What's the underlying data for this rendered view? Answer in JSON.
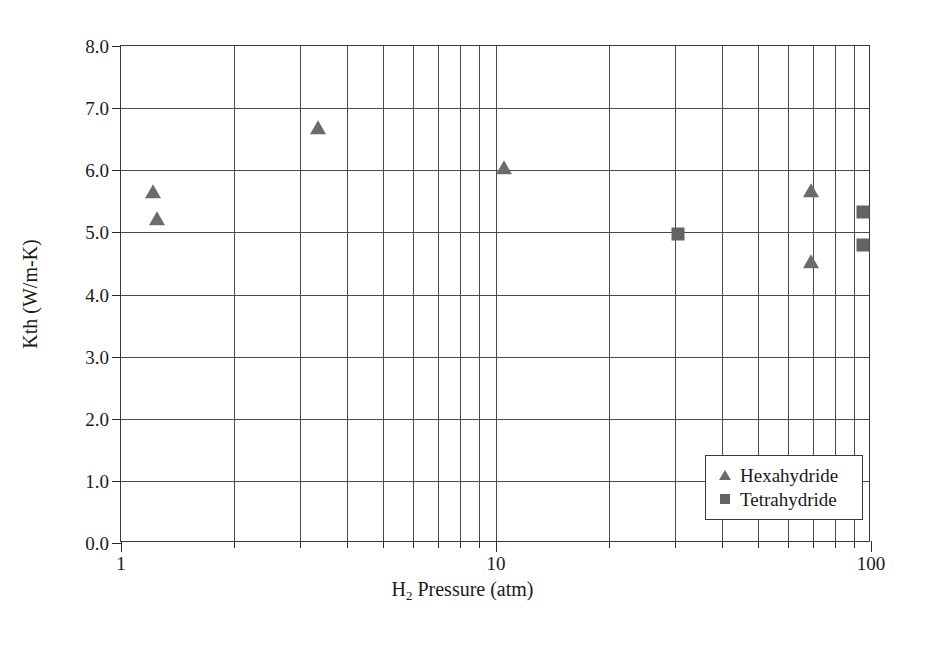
{
  "chart_data": {
    "type": "scatter",
    "title": "",
    "xlabel": "H2 Pressure (atm)",
    "xlabel_prefix": "H",
    "xlabel_sub": "2",
    "xlabel_suffix": " Pressure (atm)",
    "ylabel": "Kth (W/m-K)",
    "xscale": "log",
    "yscale": "linear",
    "xlim": [
      1,
      100
    ],
    "ylim": [
      0.0,
      8.0
    ],
    "grid": true,
    "grid_minor_x": true,
    "legend_position": "lower-right",
    "x_major_ticks": [
      1,
      10,
      100
    ],
    "x_major_tick_labels": [
      "1",
      "10",
      "100"
    ],
    "x_minor_ticks": [
      2,
      3,
      4,
      5,
      6,
      7,
      8,
      9,
      20,
      30,
      40,
      50,
      60,
      70,
      80,
      90
    ],
    "y_ticks": [
      0.0,
      1.0,
      2.0,
      3.0,
      4.0,
      5.0,
      6.0,
      7.0,
      8.0
    ],
    "y_tick_labels": [
      "0.0",
      "1.0",
      "2.0",
      "3.0",
      "4.0",
      "5.0",
      "6.0",
      "7.0",
      "8.0"
    ],
    "marker_color_hexahydride": "#6b6b6b",
    "marker_color_tetrahydride": "#636363",
    "series": [
      {
        "name": "Hexahydride",
        "marker": "triangle",
        "color": "#6b6b6b",
        "points": [
          {
            "x": 1.22,
            "y": 5.65
          },
          {
            "x": 1.25,
            "y": 5.21
          },
          {
            "x": 3.36,
            "y": 6.68
          },
          {
            "x": 10.5,
            "y": 6.04
          },
          {
            "x": 69.0,
            "y": 5.67
          },
          {
            "x": 69.0,
            "y": 4.52
          }
        ]
      },
      {
        "name": "Tetrahydride",
        "marker": "square",
        "color": "#636363",
        "points": [
          {
            "x": 30.5,
            "y": 4.97
          },
          {
            "x": 95.0,
            "y": 5.33
          },
          {
            "x": 95.0,
            "y": 4.79
          }
        ]
      }
    ],
    "legend_entries": [
      {
        "label": "Hexahydride",
        "marker": "triangle"
      },
      {
        "label": "Tetrahydride",
        "marker": "square"
      }
    ]
  }
}
